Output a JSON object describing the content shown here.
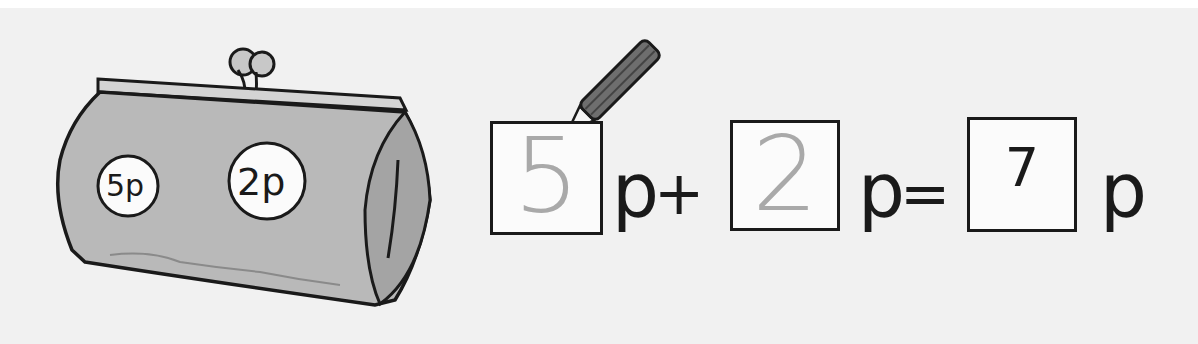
{
  "illustration": {
    "purse": {
      "coins": [
        {
          "label": "5p"
        },
        {
          "label": "2p"
        }
      ]
    }
  },
  "equation": {
    "terms": [
      {
        "value": "5",
        "style": "traced"
      },
      {
        "value": "2",
        "style": "traced"
      }
    ],
    "unit": "p",
    "plus": "+",
    "equals": "=",
    "answer": "7"
  },
  "colors": {
    "background": "#f1f1f1",
    "purse_fill": "#b9b9b9",
    "ink": "#1a1a1a",
    "traced_digit": "#a9a9a9",
    "pencil_body": "#6e6e6e"
  }
}
